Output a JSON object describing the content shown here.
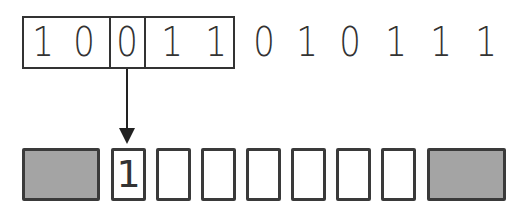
{
  "diagram": {
    "bit_stream": [
      "1",
      "0",
      "0",
      "1",
      "1",
      "0",
      "1",
      "0",
      "1",
      "1",
      "1"
    ],
    "window_bits_count": 5,
    "selected_bit_index": 2,
    "selected_bit_value": "0",
    "output_slots": [
      "1",
      "",
      "",
      "",
      "",
      "",
      "",
      ""
    ],
    "output_slot_count": 7,
    "output_first_value": "1",
    "colors": {
      "stroke": "#333333",
      "padding_block_fill": "#a4a4a4",
      "background": "#ffffff"
    }
  }
}
